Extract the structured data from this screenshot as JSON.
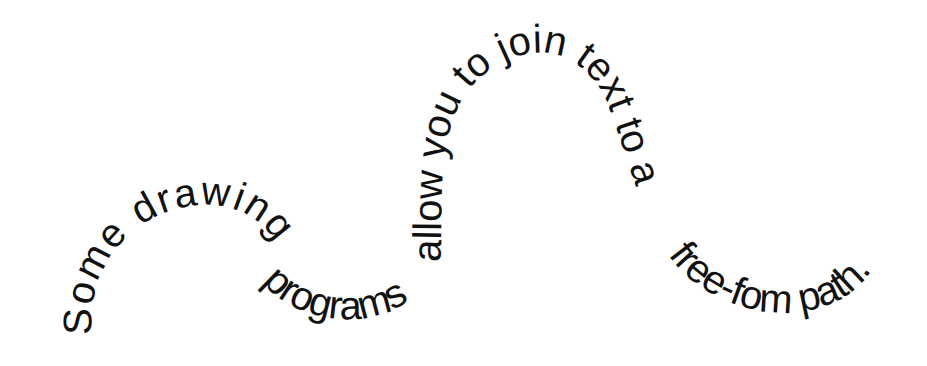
{
  "figure": {
    "full_text": "Some drawing programs allow you to join text to a free-fom path.",
    "segments": [
      {
        "text": "Some drawing"
      },
      {
        "text": "programs"
      },
      {
        "text": "allow you to join text to a"
      },
      {
        "text": "free-fom path."
      }
    ],
    "colors": {
      "text": "#111111",
      "background": "#ffffff"
    }
  }
}
